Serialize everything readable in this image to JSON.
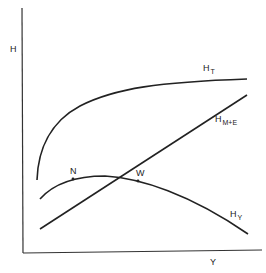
{
  "diagram": {
    "axes": {
      "y_label": "H",
      "x_label": "Y"
    },
    "curves": [
      {
        "id": "H_T",
        "label_main": "H",
        "label_sub": "T",
        "shape": "concave rising, flattening"
      },
      {
        "id": "H_M+E",
        "label_main": "H",
        "label_sub": "M+E",
        "shape": "straight rising line"
      },
      {
        "id": "H_Y",
        "label_main": "H",
        "label_sub": "Y",
        "shape": "inverted-U, rising then falling"
      }
    ],
    "points": [
      {
        "id": "N",
        "label": "N"
      },
      {
        "id": "W",
        "label": "W"
      }
    ],
    "colors": {
      "ink": "#222222",
      "background": "#ffffff"
    }
  }
}
